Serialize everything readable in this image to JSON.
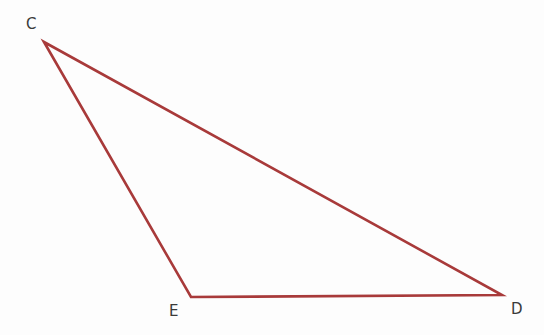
{
  "diagram": {
    "type": "triangle",
    "stroke_color": "#a83a3a",
    "label_color": "#3a3a3a",
    "vertices": [
      {
        "name": "C",
        "x": 44,
        "y": 42
      },
      {
        "name": "E",
        "x": 191,
        "y": 297
      },
      {
        "name": "D",
        "x": 502,
        "y": 295
      }
    ],
    "labels": {
      "C": "C",
      "E": "E",
      "D": "D"
    }
  }
}
